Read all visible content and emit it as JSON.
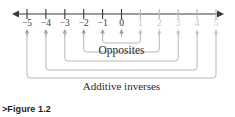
{
  "figure": {
    "caption_marker": ">",
    "caption_text": "Figure 1.2"
  },
  "labels": {
    "opposites": "Opposites",
    "additive_inverses": "Additive inverses"
  },
  "colors": {
    "axis": "#3a3a3a",
    "negative_label": "#3a3a3a",
    "zero_label": "#2b2b2b",
    "positive_label": "#c3c3c3",
    "bracket": "#b9b9b9",
    "tick_arrow": "#9a9a9a",
    "caption": "#1c1c1c",
    "background": "#ffffff"
  },
  "chart_data": {
    "type": "line",
    "title": "Figure 1.2",
    "xlabel": "",
    "ylabel": "",
    "xlim": [
      -5,
      5
    ],
    "grid": false,
    "legend": "none",
    "categories": [
      "-5",
      "-4",
      "-3",
      "-2",
      "-1",
      "0",
      "1",
      "2",
      "3",
      "4",
      "5"
    ],
    "x": [
      -5,
      -4,
      -3,
      -2,
      -1,
      0,
      1,
      2,
      3,
      4,
      5
    ],
    "tick_labels": [
      {
        "value": -5,
        "text": "−5",
        "style": "neg"
      },
      {
        "value": -4,
        "text": "−4",
        "style": "neg"
      },
      {
        "value": -3,
        "text": "−3",
        "style": "neg"
      },
      {
        "value": -2,
        "text": "−2",
        "style": "neg"
      },
      {
        "value": -1,
        "text": "−1",
        "style": "neg"
      },
      {
        "value": 0,
        "text": "0",
        "style": "zero"
      },
      {
        "value": 1,
        "text": "1",
        "style": "pos"
      },
      {
        "value": 2,
        "text": "2",
        "style": "pos"
      },
      {
        "value": 3,
        "text": "3",
        "style": "pos"
      },
      {
        "value": 4,
        "text": "4",
        "style": "pos"
      },
      {
        "value": 5,
        "text": "5",
        "style": "pos"
      }
    ],
    "pairs": [
      {
        "negative": -1,
        "positive": 1,
        "level": 1
      },
      {
        "negative": -2,
        "positive": 2,
        "level": 2
      },
      {
        "negative": -3,
        "positive": 3,
        "level": 3
      },
      {
        "negative": -4,
        "positive": 4,
        "level": 4
      },
      {
        "negative": -5,
        "positive": 5,
        "level": 5
      }
    ],
    "annotations": [
      {
        "text": "Opposites",
        "at_x": 0,
        "level": 1
      },
      {
        "text": "Additive inverses",
        "at_x": 0,
        "level": 5
      }
    ]
  },
  "geometry": {
    "axis_y": 14,
    "axis_left": 12,
    "axis_right": 224,
    "x_at_minus5": 27,
    "x_step": 18.9,
    "tick_half": 5,
    "arrow_y": 31,
    "bracket_levels_y": [
      43,
      52,
      61,
      70,
      78
    ]
  }
}
